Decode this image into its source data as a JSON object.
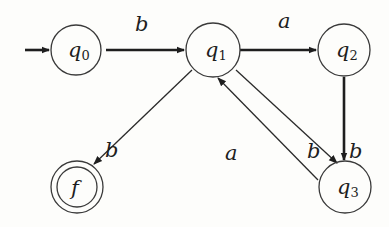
{
  "diagram": {
    "type": "finite-automaton",
    "states": [
      {
        "id": "q0",
        "name": "q",
        "subscript": "0",
        "initial": true,
        "accepting": false
      },
      {
        "id": "q1",
        "name": "q",
        "subscript": "1",
        "initial": false,
        "accepting": false
      },
      {
        "id": "q2",
        "name": "q",
        "subscript": "2",
        "initial": false,
        "accepting": false
      },
      {
        "id": "q3",
        "name": "q",
        "subscript": "3",
        "initial": false,
        "accepting": false
      },
      {
        "id": "f",
        "name": "f",
        "subscript": "",
        "initial": false,
        "accepting": true
      }
    ],
    "transitions": [
      {
        "from": "q0",
        "to": "q1",
        "label": "b"
      },
      {
        "from": "q1",
        "to": "q2",
        "label": "a"
      },
      {
        "from": "q1",
        "to": "f",
        "label": "b"
      },
      {
        "from": "q3",
        "to": "q1",
        "label": "a"
      },
      {
        "from": "q1",
        "to": "q3",
        "label": "b"
      },
      {
        "from": "q2",
        "to": "q3",
        "label": "b"
      }
    ]
  }
}
